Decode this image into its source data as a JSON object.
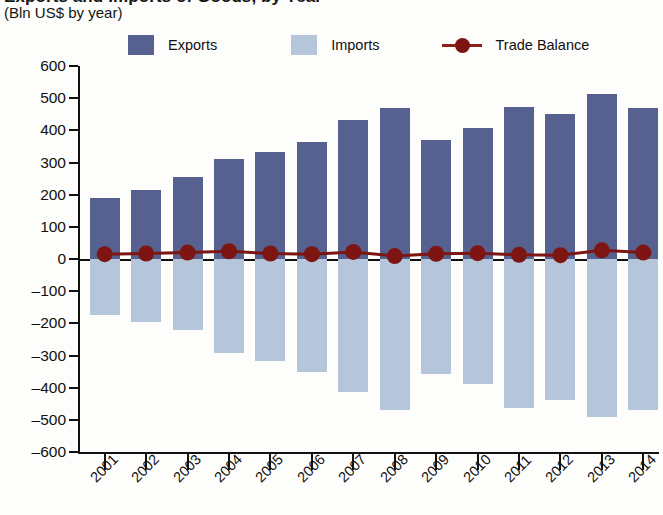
{
  "header": {
    "title_clipped": "Exports and Imports of Goods, by Year",
    "subtitle": "(Bln US$ by year)"
  },
  "legend": {
    "items": [
      {
        "label": "Exports",
        "color": "#56618f",
        "type": "bar"
      },
      {
        "label": "Imports",
        "color": "#b6c6da",
        "type": "bar"
      },
      {
        "label": "Trade Balance",
        "color": "#7d1512",
        "type": "line"
      }
    ]
  },
  "chart_data": {
    "type": "bar",
    "title": "Exports and Imports of Goods, by Year",
    "subtitle": "(Bln US$ by year)",
    "xlabel": "",
    "ylabel": "",
    "ylim": [
      -600,
      600
    ],
    "ytick_step": 100,
    "yticks": [
      600,
      500,
      400,
      300,
      200,
      100,
      0,
      -100,
      -200,
      -300,
      -400,
      -500,
      -600
    ],
    "ytick_labels": [
      "600",
      "500",
      "400",
      "300",
      "200",
      "100",
      "0",
      "–100",
      "–200",
      "–300",
      "–400",
      "–500",
      "–600"
    ],
    "grid": false,
    "legend_position": "top",
    "categories": [
      "2001",
      "2002",
      "2003",
      "2004",
      "2005",
      "2006",
      "2007",
      "2008",
      "2009",
      "2010",
      "2011",
      "2012",
      "2013",
      "2014"
    ],
    "series": [
      {
        "name": "Exports",
        "color": "#56618f",
        "values": [
          190,
          213,
          254,
          310,
          333,
          365,
          432,
          470,
          370,
          408,
          473,
          450,
          513,
          470
        ]
      },
      {
        "name": "Imports",
        "color": "#b6c6da",
        "values": [
          -175,
          -196,
          -222,
          -293,
          -318,
          -352,
          -413,
          -469,
          -357,
          -390,
          -462,
          -437,
          -490,
          -470
        ]
      },
      {
        "name": "Trade Balance",
        "color": "#7d1512",
        "type": "line",
        "values": [
          15,
          17,
          20,
          24,
          17,
          15,
          22,
          9,
          16,
          18,
          13,
          12,
          27,
          20
        ]
      }
    ]
  }
}
